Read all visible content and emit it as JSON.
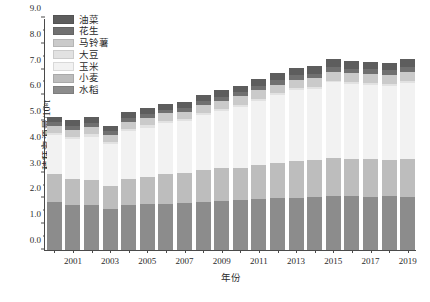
{
  "chart_data": {
    "type": "bar",
    "subtype": "stacked-bar",
    "title": "",
    "xlabel": "年份",
    "ylabel": "秸秆资源量/10⁸t",
    "ylim": [
      0,
      9.0
    ],
    "ytick_step": 1.0,
    "yticks": [
      "0.0",
      "1.0",
      "2.0",
      "3.0",
      "4.0",
      "5.0",
      "6.0",
      "7.0",
      "8.0",
      "9.0"
    ],
    "minor_ticks_per_interval": 1,
    "grid": false,
    "legend_position": "top-left",
    "categories": [
      "2000",
      "2001",
      "2002",
      "2003",
      "2004",
      "2005",
      "2006",
      "2007",
      "2008",
      "2009",
      "2010",
      "2011",
      "2012",
      "2013",
      "2014",
      "2015",
      "2016",
      "2017",
      "2018",
      "2019"
    ],
    "xtick_labels": [
      "",
      "2001",
      "",
      "2003",
      "",
      "2005",
      "",
      "2007",
      "",
      "2009",
      "",
      "2011",
      "",
      "2013",
      "",
      "2015",
      "",
      "2017",
      "",
      "2019"
    ],
    "series": [
      {
        "name": "水稻",
        "color": "#8c8c8c",
        "values": [
          1.85,
          1.76,
          1.73,
          1.59,
          1.75,
          1.77,
          1.79,
          1.82,
          1.88,
          1.91,
          1.93,
          1.98,
          2.01,
          2.03,
          2.05,
          2.08,
          2.08,
          2.06,
          2.08,
          2.07
        ]
      },
      {
        "name": "小麦",
        "color": "#bdbdbd",
        "values": [
          1.09,
          0.98,
          0.97,
          0.91,
          1.0,
          1.08,
          1.15,
          1.16,
          1.21,
          1.27,
          1.26,
          1.32,
          1.38,
          1.43,
          1.45,
          1.48,
          1.47,
          1.47,
          1.43,
          1.45
        ]
      },
      {
        "name": "玉米",
        "color": "#f2f2f2",
        "values": [
          1.53,
          1.56,
          1.7,
          1.61,
          1.85,
          1.9,
          2.0,
          2.02,
          2.13,
          2.2,
          2.37,
          2.5,
          2.62,
          2.74,
          2.75,
          2.95,
          2.88,
          2.88,
          2.84,
          2.95
        ]
      },
      {
        "name": "大豆",
        "color": "#e2e2e2",
        "values": [
          0.08,
          0.08,
          0.09,
          0.08,
          0.09,
          0.09,
          0.08,
          0.07,
          0.08,
          0.08,
          0.08,
          0.07,
          0.07,
          0.07,
          0.07,
          0.06,
          0.07,
          0.08,
          0.09,
          0.1
        ]
      },
      {
        "name": "马铃薯",
        "color": "#cacaca",
        "values": [
          0.26,
          0.27,
          0.28,
          0.26,
          0.28,
          0.29,
          0.28,
          0.29,
          0.31,
          0.32,
          0.32,
          0.33,
          0.34,
          0.34,
          0.34,
          0.35,
          0.35,
          0.35,
          0.35,
          0.35
        ]
      },
      {
        "name": "花生",
        "color": "#707070",
        "values": [
          0.16,
          0.17,
          0.17,
          0.15,
          0.16,
          0.16,
          0.15,
          0.15,
          0.16,
          0.16,
          0.17,
          0.17,
          0.17,
          0.18,
          0.18,
          0.18,
          0.18,
          0.18,
          0.18,
          0.18
        ]
      },
      {
        "name": "油菜",
        "color": "#5d5d5d",
        "values": [
          0.2,
          0.23,
          0.23,
          0.2,
          0.23,
          0.22,
          0.21,
          0.22,
          0.24,
          0.25,
          0.25,
          0.26,
          0.27,
          0.28,
          0.29,
          0.3,
          0.29,
          0.29,
          0.29,
          0.3
        ]
      }
    ],
    "legend_order_displayed": [
      "油菜",
      "花生",
      "马铃薯",
      "大豆",
      "玉米",
      "小麦",
      "水稻"
    ],
    "totals": [
      5.17,
      5.05,
      5.17,
      4.8,
      5.36,
      5.51,
      5.66,
      5.73,
      6.01,
      6.19,
      6.38,
      6.63,
      6.86,
      7.07,
      7.13,
      7.4,
      7.32,
      7.31,
      7.26,
      7.4
    ]
  }
}
